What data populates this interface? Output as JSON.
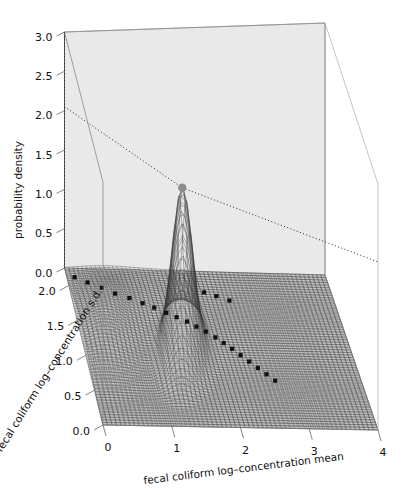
{
  "figure": {
    "type": "surface-3d",
    "background": "#ffffff",
    "panel_color": "#e9e9e9",
    "panel_edge": "#9a9a9a",
    "mesh_color": "#3a3a3a",
    "point_color": "#111111",
    "apex_marker_color": "#8c8c8c",
    "dotted_guide_color": "#222222"
  },
  "axes": {
    "x": {
      "label": "fecal coliform log–concentration mean",
      "ticks": [
        "0",
        "1",
        "2",
        "3",
        "4"
      ],
      "values": [
        0,
        1,
        2,
        3,
        4
      ],
      "range": [
        0,
        4
      ]
    },
    "y": {
      "label": "fecal coliform log–concentration s.d.",
      "ticks": [
        "0.0",
        "0.5",
        "1.0",
        "1.5",
        "2.0"
      ],
      "values": [
        0.0,
        0.5,
        1.0,
        1.5,
        2.0
      ],
      "range": [
        0,
        2.25
      ]
    },
    "z": {
      "label": "probability density",
      "ticks": [
        "0.0",
        "0.5",
        "1.0",
        "1.5",
        "2.0",
        "2.5",
        "3.0"
      ],
      "values": [
        0.0,
        0.5,
        1.0,
        1.5,
        2.0,
        2.5,
        3.0
      ],
      "range": [
        0,
        3.0
      ]
    }
  },
  "chart_data": {
    "type": "surface",
    "title": "",
    "xlabel": "fecal coliform log–concentration mean",
    "ylabel": "fecal coliform log–concentration s.d.",
    "zlabel": "probability density",
    "xlim": [
      0,
      4
    ],
    "ylim": [
      0,
      2.25
    ],
    "zlim": [
      0,
      3.0
    ],
    "grid": true,
    "legend": "none",
    "surface": {
      "description": "single sharp unimodal posterior density peak",
      "peak": {
        "x": 1.45,
        "y": 1.05,
        "z": 2.05
      },
      "secondary_ridge": {
        "x": 0.35,
        "y": 1.35,
        "z": 0.3
      },
      "nx": 60,
      "ny": 60
    },
    "guide_lines": [
      {
        "from": [
          0,
          2.25,
          2.05
        ],
        "to": [
          1.45,
          1.05,
          2.05
        ],
        "style": "dotted"
      },
      {
        "from": [
          0,
          2.25,
          0.0
        ],
        "to": [
          0,
          2.25,
          3.0
        ],
        "style": "dotted"
      },
      {
        "from": [
          1.45,
          1.05,
          2.05
        ],
        "to": [
          4,
          0,
          2.05
        ],
        "style": "dotted"
      }
    ],
    "scatter_points": {
      "name": "posterior sample draws (floor projection)",
      "marker": "filled-square",
      "x": [
        0.12,
        0.3,
        0.5,
        0.68,
        0.88,
        1.06,
        1.22,
        1.38,
        1.52,
        1.66,
        1.78,
        1.9,
        2.02,
        2.12,
        2.22,
        2.32,
        2.42,
        2.52,
        2.62,
        2.72,
        2.05,
        2.22,
        2.4
      ],
      "y": [
        2.12,
        2.05,
        1.98,
        1.9,
        1.84,
        1.77,
        1.71,
        1.64,
        1.58,
        1.52,
        1.45,
        1.38,
        1.3,
        1.22,
        1.14,
        1.05,
        0.96,
        0.87,
        0.78,
        0.69,
        1.95,
        1.9,
        1.84
      ],
      "count": 23
    }
  }
}
